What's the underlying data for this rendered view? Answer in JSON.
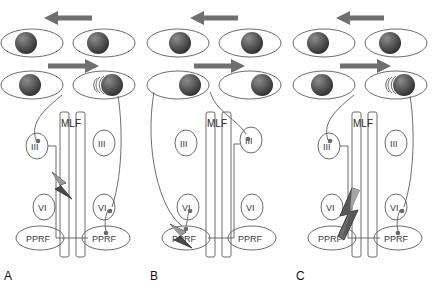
{
  "figure": {
    "background": "#ffffff",
    "line_color": "#5b5b5b",
    "arrow_color": "#6f6f6f",
    "lesion_color": "#4a4a4a",
    "text_color": "#3a3a3a"
  },
  "labels": {
    "mlf": "MLF",
    "oculomotor": "III",
    "abducens": "VI",
    "pprf": "PPRF"
  },
  "panels": [
    {
      "id": "A",
      "label": "A",
      "gaze_arrow_top": "left-arrow",
      "gaze_arrow_mid": "right-arrow",
      "eyes_row_top": [
        {
          "position": "left",
          "pupil": "center",
          "nystagmus": false
        },
        {
          "position": "right",
          "pupil": "center",
          "nystagmus": false
        }
      ],
      "eyes_row_bottom": [
        {
          "position": "left",
          "pupil": "center",
          "nystagmus": false
        },
        {
          "position": "right",
          "pupil": "right",
          "nystagmus": true
        }
      ],
      "lesion": {
        "site": "left-mlf",
        "shape": "lightning-bolt"
      },
      "active_oculomotor": "left",
      "active_abducens": "right"
    },
    {
      "id": "B",
      "label": "B",
      "gaze_arrow_top": "left-arrow",
      "gaze_arrow_mid": "right-arrow",
      "eyes_row_top": [
        {
          "position": "left",
          "pupil": "center",
          "nystagmus": false
        },
        {
          "position": "right",
          "pupil": "center",
          "nystagmus": false
        }
      ],
      "eyes_row_bottom": [
        {
          "position": "left",
          "pupil": "right",
          "nystagmus": false
        },
        {
          "position": "right",
          "pupil": "right",
          "nystagmus": false
        }
      ],
      "lesion": {
        "site": "left-pprf",
        "shape": "lightning-bolt"
      },
      "active_oculomotor": "right",
      "active_abducens": "left"
    },
    {
      "id": "C",
      "label": "C",
      "gaze_arrow_top": "left-arrow",
      "gaze_arrow_mid": "right-arrow",
      "eyes_row_top": [
        {
          "position": "left",
          "pupil": "center",
          "nystagmus": false
        },
        {
          "position": "right",
          "pupil": "center",
          "nystagmus": false
        }
      ],
      "eyes_row_bottom": [
        {
          "position": "left",
          "pupil": "center",
          "nystagmus": false
        },
        {
          "position": "right",
          "pupil": "right",
          "nystagmus": true
        }
      ],
      "lesion": {
        "site": "left-mlf-and-pprf",
        "shape": "large-lightning-bolt"
      },
      "active_oculomotor": "left",
      "active_abducens": "right"
    }
  ]
}
